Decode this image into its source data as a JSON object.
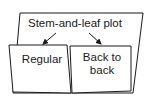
{
  "diagram": {
    "type": "foldable",
    "title": "Stem-and-leaf plot",
    "flaps": [
      {
        "label": "Regular"
      },
      {
        "label": "Back to back"
      }
    ],
    "colors": {
      "stroke": "#1a1a1a",
      "fill": "#ffffff",
      "text": "#1a1a1a"
    }
  }
}
